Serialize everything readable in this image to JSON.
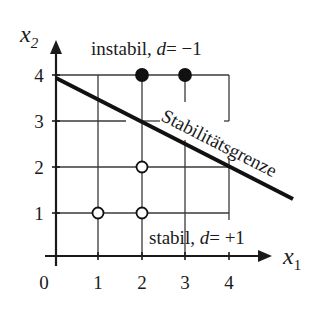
{
  "diagram": {
    "type": "integer-linear-program-stability-plot",
    "axes": {
      "x_label_base": "x",
      "x_label_sub": "1",
      "y_label_base": "x",
      "y_label_sub": "2",
      "origin_label": "0",
      "x_ticks": [
        "1",
        "2",
        "3",
        "4"
      ],
      "y_ticks": [
        "1",
        "2",
        "3",
        "4"
      ]
    },
    "labels": {
      "unstable_word": "instabil,",
      "unstable_d": "d",
      "unstable_eq": "= −1",
      "stable_word": "stabil,",
      "stable_d": "d",
      "stable_eq": "= +1",
      "boundary": "Stabilitätsgrenze"
    },
    "boundary_line": {
      "from": [
        0,
        4
      ],
      "to": [
        4,
        2
      ],
      "extends_past": true
    },
    "points": [
      {
        "x": 1,
        "y": 1,
        "filled": false,
        "class": "stabil"
      },
      {
        "x": 2,
        "y": 1,
        "filled": false,
        "class": "stabil"
      },
      {
        "x": 2,
        "y": 2,
        "filled": false,
        "class": "stabil"
      },
      {
        "x": 2,
        "y": 4,
        "filled": true,
        "class": "instabil"
      },
      {
        "x": 3,
        "y": 4,
        "filled": true,
        "class": "instabil"
      }
    ],
    "colors": {
      "ink": "#1a1a1a",
      "grid": "#3a3a3a",
      "background": "#ffffff"
    }
  }
}
